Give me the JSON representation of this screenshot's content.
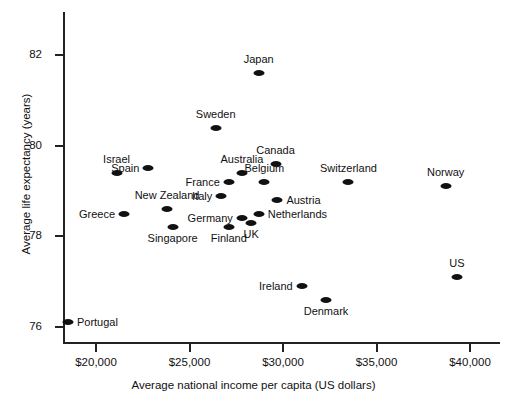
{
  "chart_data": {
    "type": "scatter",
    "title": "",
    "xlabel": "Average national income per capita (US dollars)",
    "ylabel": "Average life expectancy (years)",
    "xlim": [
      18200,
      41500
    ],
    "ylim": [
      75.6,
      82.8
    ],
    "xticks": [
      20000,
      25000,
      30000,
      35000,
      40000
    ],
    "xtick_labels": [
      "$20,000",
      "$25,000",
      "$30,000",
      "$35,000",
      "$40,000"
    ],
    "yticks": [
      76,
      78,
      80,
      82
    ],
    "ytick_labels": [
      "76",
      "78",
      "80",
      "82"
    ],
    "grid": false,
    "legend": false,
    "marker_color": "#111111",
    "points": [
      {
        "label": "Japan",
        "x": 28700,
        "y": 81.6,
        "label_pos": "above"
      },
      {
        "label": "Sweden",
        "x": 26400,
        "y": 80.4,
        "label_pos": "above"
      },
      {
        "label": "Canada",
        "x": 29600,
        "y": 79.6,
        "label_pos": "above"
      },
      {
        "label": "Australia",
        "x": 27800,
        "y": 79.4,
        "label_pos": "above"
      },
      {
        "label": "Spain",
        "x": 22800,
        "y": 79.5,
        "label_pos": "left"
      },
      {
        "label": "Israel",
        "x": 21100,
        "y": 79.4,
        "label_pos": "above"
      },
      {
        "label": "Switzerland",
        "x": 33500,
        "y": 79.2,
        "label_pos": "above"
      },
      {
        "label": "Norway",
        "x": 38700,
        "y": 79.1,
        "label_pos": "above"
      },
      {
        "label": "France",
        "x": 27100,
        "y": 79.2,
        "label_pos": "left"
      },
      {
        "label": "Belgium",
        "x": 29000,
        "y": 79.2,
        "label_pos": "above"
      },
      {
        "label": "Italy",
        "x": 26700,
        "y": 78.9,
        "label_pos": "left"
      },
      {
        "label": "Austria",
        "x": 29700,
        "y": 78.8,
        "label_pos": "right"
      },
      {
        "label": "Netherlands",
        "x": 28700,
        "y": 78.5,
        "label_pos": "right"
      },
      {
        "label": "Germany",
        "x": 27800,
        "y": 78.4,
        "label_pos": "left"
      },
      {
        "label": "UK",
        "x": 28300,
        "y": 78.3,
        "label_pos": "below"
      },
      {
        "label": "Finland",
        "x": 27100,
        "y": 78.2,
        "label_pos": "below"
      },
      {
        "label": "Greece",
        "x": 21500,
        "y": 78.5,
        "label_pos": "left"
      },
      {
        "label": "New Zealand",
        "x": 23800,
        "y": 78.6,
        "label_pos": "above"
      },
      {
        "label": "Singapore",
        "x": 24100,
        "y": 78.2,
        "label_pos": "below"
      },
      {
        "label": "Ireland",
        "x": 31000,
        "y": 76.9,
        "label_pos": "left"
      },
      {
        "label": "Denmark",
        "x": 32300,
        "y": 76.6,
        "label_pos": "below"
      },
      {
        "label": "US",
        "x": 39300,
        "y": 77.1,
        "label_pos": "above"
      },
      {
        "label": "Portugal",
        "x": 18500,
        "y": 76.1,
        "label_pos": "right"
      }
    ]
  }
}
